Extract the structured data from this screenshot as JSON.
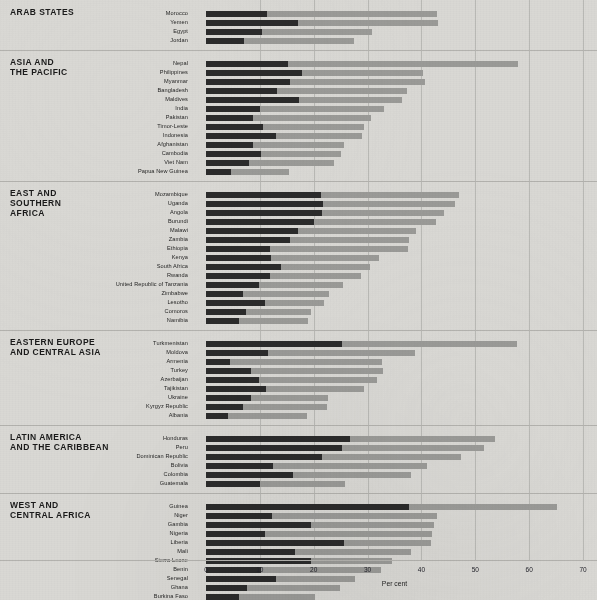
{
  "chart_data": {
    "type": "bar",
    "orientation": "horizontal",
    "stacked": true,
    "title": "",
    "xlabel": "Per cent",
    "ylabel": "",
    "xlim": [
      0,
      70
    ],
    "xticks": [
      0,
      10,
      20,
      30,
      40,
      50,
      60,
      70
    ],
    "grid": true,
    "legend_position": "none",
    "colors": {
      "dark_segment": "#2b2b2b",
      "light_segment": "#9a9a97",
      "background": "#d9d8d4",
      "rule": "#b3b2ae"
    },
    "series": [
      {
        "name": "dark-segment",
        "color": "#2b2b2b"
      },
      {
        "name": "light-segment",
        "color": "#9a9a97"
      }
    ],
    "groups": [
      {
        "label": "ARAB STATES",
        "categories": [
          "Morocco",
          "Yemen",
          "Egypt",
          "Jordan"
        ],
        "dark": [
          11.3,
          17.1,
          10.4,
          7.1
        ],
        "total": [
          42.9,
          43.1,
          30.8,
          27.4
        ]
      },
      {
        "label": "ASIA AND\nTHE PACIFIC",
        "categories": [
          "Nepal",
          "Philippines",
          "Myanmar",
          "Bangladesh",
          "Maldives",
          "India",
          "Pakistan",
          "Timor-Leste",
          "Indonesia",
          "Afghanistan",
          "Cambodia",
          "Viet Nam",
          "Papua New Guinea"
        ],
        "dark": [
          15.2,
          17.9,
          15.6,
          13.2,
          17.3,
          10.0,
          8.8,
          10.6,
          13.0,
          8.8,
          10.3,
          8.0,
          4.6
        ],
        "total": [
          58.0,
          40.2,
          40.6,
          37.4,
          36.3,
          33.1,
          30.6,
          29.3,
          28.9,
          25.6,
          25.0,
          23.7,
          15.5
        ]
      },
      {
        "label": "EAST AND\nSOUTHERN\nAFRICA",
        "categories": [
          "Mozambique",
          "Uganda",
          "Angola",
          "Burundi",
          "Malawi",
          "Zambia",
          "Ethiopia",
          "Kenya",
          "South Africa",
          "Rwanda",
          "United Republic of Tanzania",
          "Zimbabwe",
          "Lesotho",
          "Comoros",
          "Namibia"
        ],
        "dark": [
          21.3,
          21.8,
          21.6,
          20.0,
          17.1,
          15.6,
          11.9,
          12.0,
          14.0,
          11.9,
          9.8,
          6.8,
          11.0,
          7.4,
          6.2
        ],
        "total": [
          46.9,
          46.2,
          44.2,
          42.7,
          39.0,
          37.7,
          37.5,
          32.1,
          30.5,
          28.7,
          25.5,
          22.9,
          22.0,
          19.5,
          19.0
        ]
      },
      {
        "label": "EASTERN EUROPE\nAND CENTRAL ASIA",
        "categories": [
          "Turkmenistan",
          "Moldova",
          "Armenia",
          "Turkey",
          "Azerbaijan",
          "Tajikistan",
          "Ukraine",
          "Kyrgyz Republic",
          "Albania"
        ],
        "dark": [
          25.2,
          11.5,
          4.5,
          8.3,
          9.8,
          11.1,
          8.4,
          6.8,
          4.0
        ],
        "total": [
          57.7,
          38.8,
          32.7,
          32.9,
          31.8,
          29.3,
          22.7,
          22.5,
          18.7
        ]
      },
      {
        "label": "LATIN AMERICA\nAND THE CARIBBEAN",
        "categories": [
          "Honduras",
          "Peru",
          "Dominican Republic",
          "Bolivia",
          "Colombia",
          "Guatemala"
        ],
        "dark": [
          26.7,
          25.3,
          21.6,
          12.5,
          16.2,
          10.0
        ],
        "total": [
          53.6,
          51.7,
          47.4,
          41.1,
          38.0,
          25.9
        ]
      },
      {
        "label": "WEST AND\nCENTRAL AFRICA",
        "categories": [
          "Guinea",
          "Niger",
          "Gambia",
          "Nigeria",
          "Liberia",
          "Mali",
          "Sierra Leone",
          "Benin",
          "Senegal",
          "Ghana",
          "Burkina Faso"
        ],
        "dark": [
          37.7,
          12.3,
          19.5,
          10.9,
          25.7,
          16.5,
          19.5,
          10.2,
          13.0,
          7.7,
          6.2
        ],
        "total": [
          65.1,
          42.9,
          42.3,
          41.9,
          41.8,
          38.0,
          34.5,
          32.5,
          27.6,
          24.8,
          20.2
        ]
      }
    ]
  }
}
